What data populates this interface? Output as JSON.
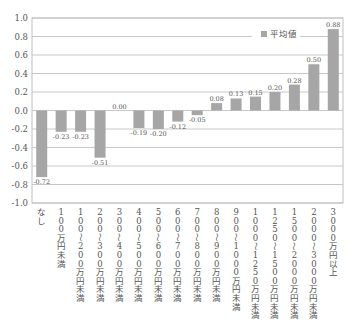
{
  "chart_data": {
    "type": "bar",
    "title": "",
    "xlabel": "",
    "ylabel": "",
    "ylim": [
      -1.0,
      1.0
    ],
    "yticks": [
      "1.0",
      "0.8",
      "0.6",
      "0.4",
      "0.2",
      "0.0",
      "-0.2",
      "-0.4",
      "-0.6",
      "-0.8",
      "-1.0"
    ],
    "grid": true,
    "legend": {
      "position": "upper-right",
      "entries": [
        "平均値"
      ]
    },
    "bar_color": "#a6a6a6",
    "categories": [
      "なし",
      "100万円未満",
      "100〜200万円未満",
      "200〜300万円未満",
      "300〜400万円未満",
      "400〜500万円未満",
      "500〜600万円未満",
      "600〜700万円未満",
      "700〜800万円未満",
      "800〜900万円未満",
      "900〜1000万円未満",
      "1000〜1250万円未満",
      "1250〜1500万円未満",
      "1500〜2000万円未満",
      "2000〜3000万円未満",
      "3000万円以上"
    ],
    "series": [
      {
        "name": "平均値",
        "values": [
          -0.72,
          -0.23,
          -0.23,
          -0.51,
          0.0,
          -0.19,
          -0.2,
          -0.12,
          -0.05,
          0.08,
          0.13,
          0.15,
          0.2,
          0.28,
          0.5,
          0.88
        ],
        "labels": [
          "-0.72",
          "-0.23",
          "-0.23",
          "-0.51",
          "0.00",
          "-0.19",
          "-0.20",
          "-0.12",
          "-0.05",
          "0.08",
          "0.13",
          "0.15",
          "0.20",
          "0.28",
          "0.50",
          "0.88"
        ]
      }
    ]
  }
}
